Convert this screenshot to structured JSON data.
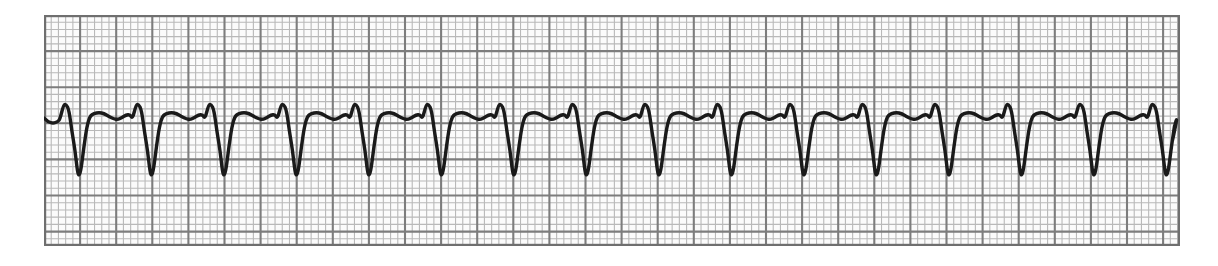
{
  "document": {
    "kind": "ecg-rhythm-strip",
    "title": "ECG Rhythm Strip",
    "lead_label": "",
    "annotations": []
  },
  "paper": {
    "background_color": "#ffffff",
    "strip_background_color": "#fbfbfb",
    "minor_grid_color": "#b9b9b9",
    "major_grid_color": "#7d7d7d",
    "border_color": "#6f6f6f",
    "trace_color": "#1a1a1a",
    "minor_square_px": 7.22,
    "major_square_px": 36.1,
    "strip_left_px": 44,
    "strip_top_px": 15,
    "strip_width_px": 1136,
    "strip_height_px": 231
  },
  "chart_data": {
    "type": "line",
    "xlabel": "Time",
    "ylabel": "Amplitude",
    "grid": true,
    "legend": "none",
    "paper_speed_mm_per_s": 25,
    "gain_mm_per_mV": 10,
    "mm_per_minor_square": 1,
    "baseline_y_px": 120,
    "r_peak_y_px": 104,
    "s_trough_y_px": 176,
    "t_peak_y_px": 113,
    "beat_period_px": 72.5,
    "beat_count": 16,
    "first_r_peak_x_px": 66,
    "rhythm_description": "Wide-complex regular tachycardia with deep QS deflections and broad opposite-direction T waves",
    "x": [
      0,
      1,
      2,
      3,
      4,
      5,
      6,
      7,
      8,
      9,
      10,
      11,
      12,
      13,
      14,
      15
    ],
    "r_peak_x_px": [
      66,
      138.5,
      211,
      283.5,
      356,
      428.5,
      501,
      573.5,
      646,
      718.5,
      791,
      863.5,
      936,
      1008.5,
      1081,
      1153.5
    ],
    "s_trough_x_px": [
      78,
      150.5,
      223,
      295.5,
      368,
      440.5,
      513,
      585.5,
      658,
      730.5,
      803,
      875.5,
      948,
      1020.5,
      1093,
      1165.5
    ],
    "t_peak_x_px": [
      101,
      173.5,
      246,
      318.5,
      391,
      463.5,
      536,
      608.5,
      681,
      753.5,
      826,
      898.5,
      971,
      1043.5,
      1116
    ],
    "beat_labels": [
      "1",
      "2",
      "3",
      "4",
      "5",
      "6",
      "7",
      "8",
      "9",
      "10",
      "11",
      "12",
      "13",
      "14",
      "15",
      "16"
    ]
  }
}
